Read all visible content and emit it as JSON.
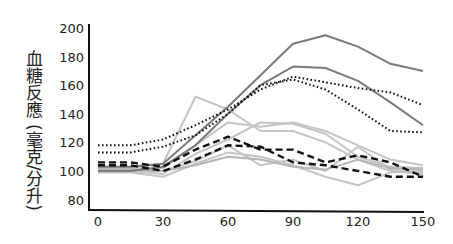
{
  "chart_data": {
    "type": "line",
    "title": "",
    "xlabel": "",
    "ylabel": "血糖反應 (毫克/分升)",
    "ylabel_main": "血糖反應",
    "ylabel_unit": "(毫克/分升)",
    "x": [
      0,
      15,
      30,
      45,
      60,
      75,
      90,
      105,
      120,
      135,
      150
    ],
    "x_ticks": [
      0,
      30,
      60,
      90,
      120,
      150
    ],
    "y_ticks": [
      80,
      100,
      120,
      140,
      160,
      180,
      200
    ],
    "xlim": [
      0,
      150
    ],
    "ylim": [
      78,
      200
    ],
    "grid": false,
    "legend": "none",
    "series": [
      {
        "name": "solid-dark-1",
        "style": "solid",
        "color": "#7a7a7a",
        "values": [
          103,
          103,
          105,
          125,
          145,
          167,
          189,
          195,
          187,
          175,
          170
        ]
      },
      {
        "name": "solid-dark-2",
        "style": "solid",
        "color": "#7a7a7a",
        "values": [
          100,
          100,
          103,
          118,
          140,
          160,
          173,
          172,
          163,
          148,
          132
        ]
      },
      {
        "name": "dotted-1",
        "style": "dotted",
        "color": "#111111",
        "values": [
          118,
          118,
          122,
          132,
          143,
          157,
          166,
          162,
          158,
          155,
          146
        ]
      },
      {
        "name": "dotted-2",
        "style": "dotted",
        "color": "#111111",
        "values": [
          113,
          113,
          117,
          125,
          140,
          160,
          164,
          157,
          143,
          128,
          127
        ]
      },
      {
        "name": "dashed-1",
        "style": "dashed",
        "color": "#111111",
        "values": [
          106,
          106,
          103,
          115,
          124,
          115,
          115,
          106,
          111,
          106,
          96
        ]
      },
      {
        "name": "dashed-2",
        "style": "dashed",
        "color": "#111111",
        "values": [
          104,
          104,
          100,
          108,
          118,
          117,
          106,
          104,
          100,
          96,
          96
        ]
      },
      {
        "name": "light-1",
        "style": "solid",
        "color": "#c4c4c4",
        "values": [
          102,
          102,
          105,
          152,
          143,
          128,
          128,
          120,
          108,
          100,
          98
        ]
      },
      {
        "name": "light-2",
        "style": "solid",
        "color": "#c4c4c4",
        "values": [
          101,
          101,
          102,
          118,
          134,
          131,
          134,
          128,
          118,
          108,
          104
        ]
      },
      {
        "name": "light-3",
        "style": "solid",
        "color": "#c4c4c4",
        "values": [
          100,
          100,
          98,
          112,
          122,
          134,
          133,
          126,
          110,
          103,
          102
        ]
      },
      {
        "name": "light-4",
        "style": "solid",
        "color": "#c4c4c4",
        "values": [
          99,
          99,
          96,
          105,
          113,
          110,
          104,
          96,
          90,
          99,
          100
        ]
      },
      {
        "name": "light-5",
        "style": "solid",
        "color": "#c4c4c4",
        "values": [
          100,
          100,
          100,
          107,
          118,
          104,
          108,
          100,
          117,
          101,
          99
        ]
      },
      {
        "name": "light-6",
        "style": "solid",
        "color": "#b4b4b4",
        "values": [
          101,
          101,
          100,
          104,
          110,
          108,
          103,
          101,
          108,
          102,
          101
        ]
      }
    ]
  }
}
